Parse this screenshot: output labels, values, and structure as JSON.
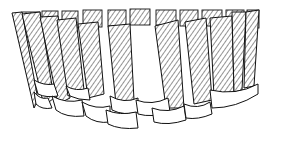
{
  "figure": {
    "stroke_color": "#111111",
    "background": "#ffffff",
    "hatch_spacing": 4,
    "back_slats": [
      {
        "x1": 22,
        "x2": 40,
        "top": 12,
        "bottom": 30
      },
      {
        "x1": 42,
        "x2": 58,
        "top": 11,
        "bottom": 28
      },
      {
        "x1": 62,
        "x2": 78,
        "top": 11,
        "bottom": 28
      },
      {
        "x1": 83,
        "x2": 102,
        "top": 10,
        "bottom": 27
      },
      {
        "x1": 108,
        "x2": 126,
        "top": 10,
        "bottom": 26
      },
      {
        "x1": 130,
        "x2": 150,
        "top": 9,
        "bottom": 25
      },
      {
        "x1": 156,
        "x2": 176,
        "top": 10,
        "bottom": 25
      },
      {
        "x1": 180,
        "x2": 198,
        "top": 10,
        "bottom": 26
      },
      {
        "x1": 202,
        "x2": 222,
        "top": 10,
        "bottom": 26
      },
      {
        "x1": 226,
        "x2": 244,
        "top": 10,
        "bottom": 27
      },
      {
        "x1": 247,
        "x2": 259,
        "top": 10,
        "bottom": 28
      }
    ],
    "front_slats": [
      {
        "pts": "12,13 22,12 38,100 34,108"
      },
      {
        "pts": "22,14 40,12 54,98 44,106"
      },
      {
        "pts": "40,17 58,16 70,98 58,104"
      },
      {
        "pts": "57,20 76,18 84,90 68,96"
      },
      {
        "pts": "78,24 98,22 104,94 88,98"
      },
      {
        "pts": "108,26 130,24 134,100 116,104"
      },
      {
        "pts": "155,26 178,20 184,108 166,108"
      },
      {
        "pts": "185,22 206,18 212,100 194,104"
      },
      {
        "pts": "210,18 232,16 234,94 214,96"
      },
      {
        "pts": "232,12 246,12 242,90 234,92"
      },
      {
        "pts": "246,12 259,10 254,86 244,88"
      }
    ],
    "bands": [
      {
        "d": "M34,80 Q44,86 54,84 L58,96 Q46,98 38,94 Z"
      },
      {
        "d": "M34,92 Q40,100 48,98 L52,108 Q42,110 36,104 Z"
      },
      {
        "d": "M52,96 Q66,104 82,100 L84,116 Q66,118 56,110 Z"
      },
      {
        "d": "M66,86 Q76,92 88,88 L90,100 Q78,100 70,96 Z"
      },
      {
        "d": "M82,102 Q96,110 110,106 L110,122 Q96,124 86,116 Z"
      },
      {
        "d": "M110,96 Q124,104 138,98 L138,112 Q124,116 112,110 Z"
      },
      {
        "d": "M106,110 Q120,116 136,112 L138,128 Q120,130 108,124 Z"
      },
      {
        "d": "M136,100 Q152,106 168,98 L170,112 Q152,118 138,114 Z"
      },
      {
        "d": "M152,108 Q168,114 184,106 L186,120 Q168,126 154,122 Z"
      },
      {
        "d": "M184,104 Q198,110 210,102 L212,114 Q198,120 186,118 Z"
      },
      {
        "d": "M210,90 Q236,96 258,84 L258,94 Q236,108 212,108 Z"
      }
    ]
  }
}
